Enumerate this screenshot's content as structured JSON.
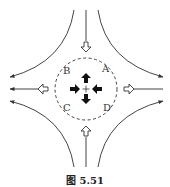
{
  "figure": {
    "caption": "图 5.51",
    "point_labels": {
      "A": "A",
      "B": "B",
      "C": "C",
      "D": "D"
    },
    "center_marker": "+",
    "colors": {
      "stroke": "#444444",
      "fill_solid": "#111111",
      "background": "#ffffff"
    },
    "elements": {
      "dashed_circle": {
        "cx": 86,
        "cy": 89,
        "r": 31
      },
      "inflow_open_arrows": [
        "top-pointing-down",
        "bottom-pointing-up"
      ],
      "outflow_open_arrows": [
        "left-pointing-left",
        "right-pointing-right"
      ],
      "solid_center_arrows": [
        "up-pointing-up",
        "left-side-pointing-right",
        "right-side-pointing-left",
        "down-pointing-down"
      ]
    }
  }
}
